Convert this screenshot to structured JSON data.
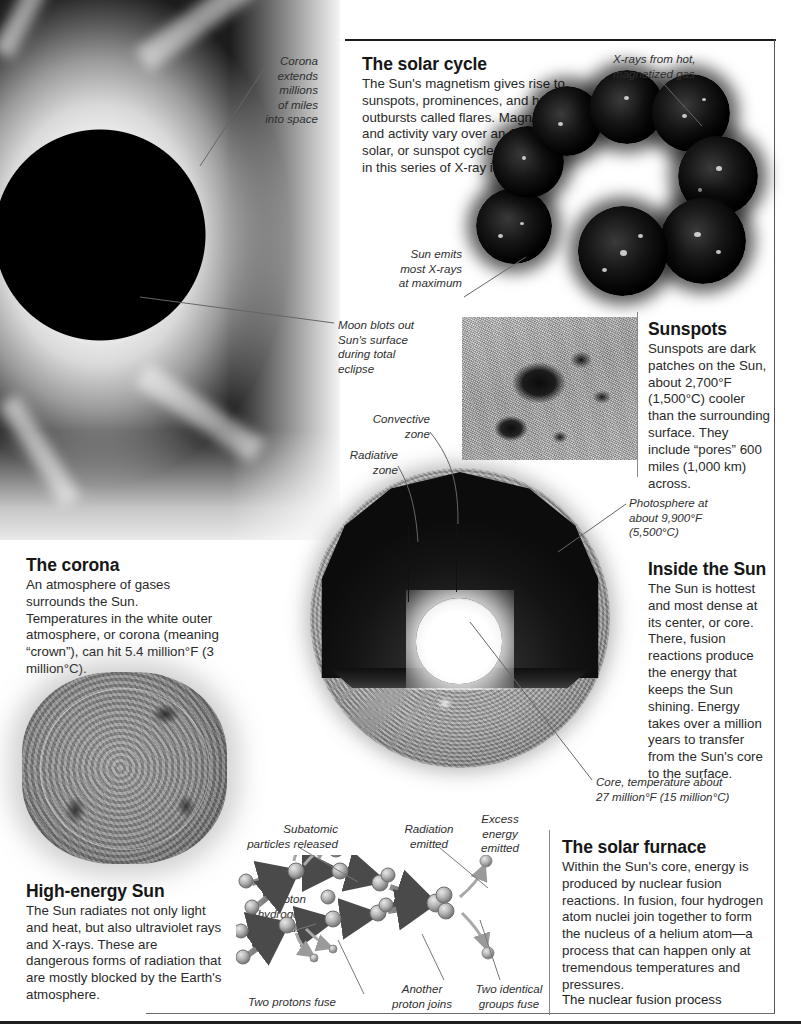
{
  "page": {
    "title": "The Sun"
  },
  "solar_cycle": {
    "heading": "The solar cycle",
    "body": "The Sun's magnetism gives rise to sunspots, prominences, and huge outbursts called flares. Magnetism and activity vary over an 11-year solar, or sunspot cycle, shown here in this series of X-ray images.",
    "callout_xrays": "X-rays from hot,\nmagnetized gas",
    "callout_maximum": "Sun emits\nmost X-rays\nat maximum",
    "image_count": 8
  },
  "corona_photo": {
    "callout_corona": "Corona\nextends\nmillions\nof miles\ninto space",
    "callout_moon": "Moon blots out\nSun's surface\nduring total\neclipse"
  },
  "sunspots": {
    "heading": "Sunspots",
    "body": "Sunspots are dark patches on the Sun, about 2,700°F (1,500°C) cooler than the surrounding surface. They include “pores” 600 miles (1,000 km) across."
  },
  "corona": {
    "heading": "The corona",
    "body": "An atmosphere of gases surrounds the Sun. Temperatures in the white outer atmosphere, or corona (meaning “crown”), can hit 5.4 million°F (3 million°C)."
  },
  "inside_sun": {
    "heading": "Inside the Sun",
    "body": "The Sun is hottest and most dense at its center, or core. There, fusion reactions produce the energy that keeps the Sun shining. Energy takes over a million years to transfer from the Sun's core to the surface.",
    "callout_convective": "Convective\nzone",
    "callout_radiative": "Radiative\nzone",
    "callout_photosphere": "Photosphere at\nabout 9,900°F\n(5,500°C)",
    "callout_core": "Core, temperature about\n27 million°F (15 million°C)"
  },
  "high_energy": {
    "heading": "High-energy Sun",
    "body": "The Sun radiates not only light and heat, but also ultraviolet rays and X-rays. These are dangerous forms of radiation that are mostly blocked by the Earth's atmosphere."
  },
  "solar_furnace": {
    "heading": "The solar furnace",
    "body": "Within the Sun's core, energy is produced by nuclear fusion reactions. In fusion, four hydrogen atom nuclei join together to form the nucleus of a helium atom—a process that can happen only at tremendous temperatures and pressures.",
    "figure_caption": "The nuclear fusion process"
  },
  "fusion_diagram": {
    "labels": {
      "subatomic": "Subatomic\nparticles released",
      "radiation": "Radiation\nemitted",
      "excess": "Excess\nenergy\nemitted",
      "proton": "Proton\n(hydrogen\nnucleus)",
      "two_protons": "Two protons fuse",
      "another_proton": "Another\nproton joins",
      "two_groups": "Two identical\ngroups fuse"
    }
  },
  "colors": {
    "ink": "#231f20",
    "heading": "#161616",
    "body": "#2a2a2a",
    "caption": "#2f2f2f",
    "rule": "#1a1a1a",
    "leader": "#555555"
  }
}
